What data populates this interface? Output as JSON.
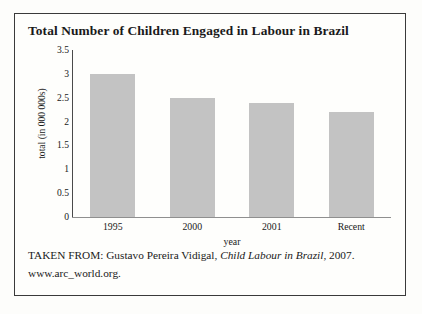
{
  "figure": {
    "title": "Total Number of Children Engaged in Labour in Brazil",
    "caption": {
      "prefix": "TAKEN FROM: Gustavo Pereira Vidigal, ",
      "source_title": "Child Labour in Brazil",
      "suffix": ", 2007.",
      "url": "www.arc_world.org."
    }
  },
  "chart_data": {
    "type": "bar",
    "title": "Total Number of Children Engaged in Labour in Brazil",
    "categories": [
      "1995",
      "2000",
      "2001",
      "Recent"
    ],
    "values": [
      3,
      2.5,
      2.4,
      2.2
    ],
    "xlabel": "year",
    "ylabel": "total (in 000 000s)",
    "ylim": [
      0,
      3.5
    ],
    "yticks": [
      "0",
      "0.5",
      "1",
      "1.5",
      "2",
      "2.5",
      "3",
      "3.5"
    ],
    "ytick_values": [
      0,
      0.5,
      1,
      1.5,
      2,
      2.5,
      3,
      3.5
    ],
    "grid": false,
    "legend": "none",
    "bar_color": "#c3c3c3",
    "axis_color": "#4a4a4a"
  }
}
